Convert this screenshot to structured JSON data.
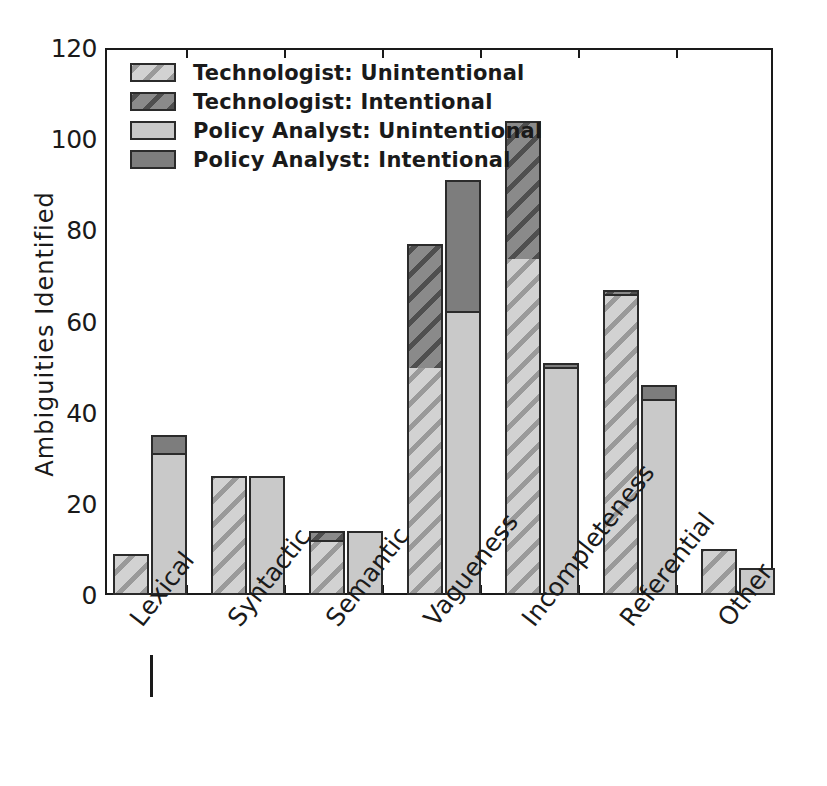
{
  "chart_data": {
    "type": "bar",
    "subtype": "grouped-stacked",
    "title": "",
    "xlabel": "",
    "ylabel": "Ambiguities  Identified",
    "ylim": [
      0,
      120
    ],
    "yticks": [
      0,
      20,
      40,
      60,
      80,
      100,
      120
    ],
    "ytick_labels": [
      "0",
      "20",
      "40",
      "60",
      "80",
      "100",
      "120"
    ],
    "grid": false,
    "legend_position": "upper-left",
    "categories": [
      "Lexical",
      "Syntactic",
      "Semantic",
      "Vagueness",
      "Incompleteness",
      "Referential",
      "Other"
    ],
    "series": [
      {
        "name": "Technologist: Unintentional",
        "values": [
          9,
          26,
          12,
          50,
          74,
          66,
          10
        ]
      },
      {
        "name": "Technologist: Intentional",
        "values": [
          0,
          0,
          2,
          27,
          30,
          1,
          0
        ]
      },
      {
        "name": "Policy Analyst: Unintentional",
        "values": [
          31,
          26,
          14,
          62,
          50,
          43,
          6
        ]
      },
      {
        "name": "Policy Analyst: Intentional",
        "values": [
          4,
          0,
          0,
          29,
          1,
          3,
          0
        ]
      }
    ],
    "group_totals": {
      "technologist": [
        9,
        26,
        14,
        77,
        104,
        67,
        10
      ],
      "policy_analyst": [
        35,
        26,
        14,
        91,
        51,
        46,
        6
      ]
    }
  },
  "legend": {
    "items": [
      {
        "label": "Technologist: Unintentional",
        "swatch": "light-hatch"
      },
      {
        "label": "Technologist:  Intentional",
        "swatch": "dark-hatch"
      },
      {
        "label": "Policy Analyst: Unintentional",
        "swatch": "light-plain"
      },
      {
        "label": "Policy Analyst:  Intentional",
        "swatch": "dark-plain"
      }
    ]
  },
  "colors": {
    "light_fill": "#c9c9c9",
    "dark_fill": "#7d7d7d",
    "hatch_light_line": "#9a9a9a",
    "hatch_dark_line": "#4f4f4f",
    "outline": "#2b2b2b",
    "axis": "#1a1a1a",
    "background": "#ffffff"
  },
  "annotations": {
    "lexical_tick_mark": "|"
  }
}
